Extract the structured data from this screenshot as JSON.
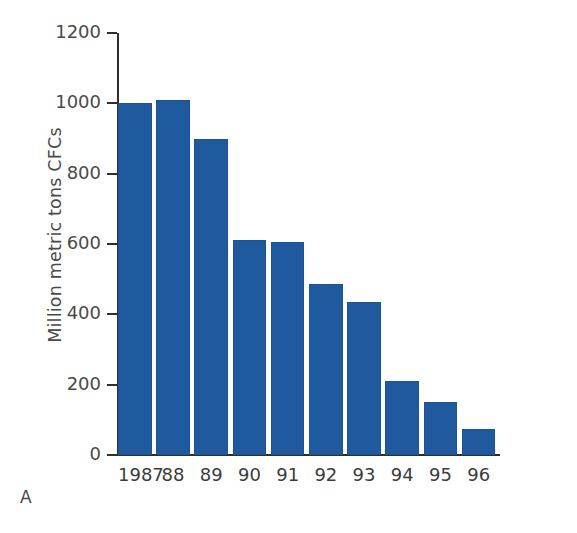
{
  "chart_data": {
    "type": "bar",
    "title": "",
    "panel_label": "A",
    "xlabel": "",
    "ylabel": "Million metric tons CFCs",
    "categories": [
      "1987",
      "88",
      "89",
      "90",
      "91",
      "92",
      "93",
      "94",
      "95",
      "96"
    ],
    "values": [
      1000,
      1010,
      900,
      610,
      605,
      485,
      435,
      210,
      150,
      75
    ],
    "series": [
      {
        "name": "CFC production",
        "values": [
          1000,
          1010,
          900,
          610,
          605,
          485,
          435,
          210,
          150,
          75
        ]
      }
    ],
    "ylim": [
      0,
      1200
    ],
    "yticks": [
      0,
      200,
      400,
      600,
      800,
      1000,
      1200
    ],
    "ytick_labels": [
      "0",
      "200",
      "400",
      "600",
      "800",
      "1000",
      "1200"
    ],
    "grid": false,
    "legend": false,
    "legend_position": "none",
    "bar_color": "#1F5A9E",
    "axis_color": "#2E2E2E",
    "text_color": "#4A4A4A",
    "background_color": "#FFFFFF"
  }
}
